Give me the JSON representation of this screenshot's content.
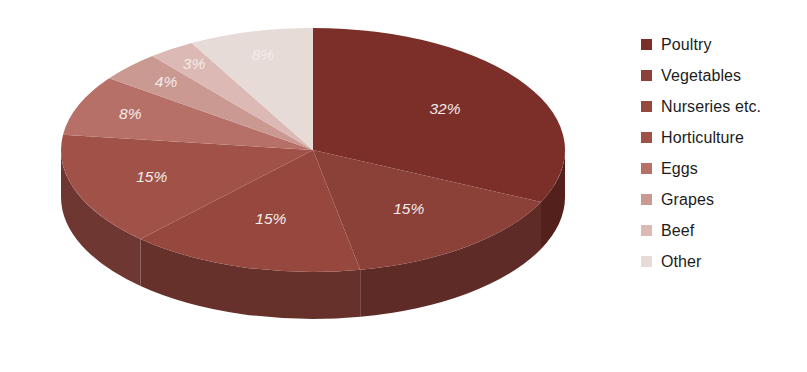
{
  "chart_data": {
    "type": "pie",
    "title": "",
    "subtitle": "",
    "xlabel": "",
    "ylabel": "",
    "legend_position": "right",
    "three_d": true,
    "start_angle_deg": 0,
    "direction": "clockwise",
    "categories": [
      "Poultry",
      "Vegetables",
      "Nurseries etc.",
      "Horticulture",
      "Eggs",
      "Grapes",
      "Beef",
      "Other"
    ],
    "values": [
      32,
      15,
      15,
      15,
      8,
      4,
      3,
      8
    ],
    "value_unit": "%",
    "data_labels": [
      "32%",
      "15%",
      "15%",
      "15%",
      "8%",
      "4%",
      "3%",
      "8%"
    ],
    "colors": [
      "#7b2f28",
      "#8b4038",
      "#96483f",
      "#a05249",
      "#b77068",
      "#c99992",
      "#dcb9b4",
      "#e6dbd6"
    ],
    "side_colors": [
      "#53201c",
      "#5e2b26",
      "#67312b",
      "#6e3731",
      "#7f4b45",
      "#8d6762",
      "#9c7e79",
      "#a89a95"
    ]
  },
  "legend": {
    "items": [
      {
        "label": "Poultry",
        "color": "#7b2f28"
      },
      {
        "label": "Vegetables",
        "color": "#8b4038"
      },
      {
        "label": "Nurseries etc.",
        "color": "#96483f"
      },
      {
        "label": "Horticulture",
        "color": "#a05249"
      },
      {
        "label": "Eggs",
        "color": "#b77068"
      },
      {
        "label": "Grapes",
        "color": "#c99992"
      },
      {
        "label": "Beef",
        "color": "#dcb9b4"
      },
      {
        "label": "Other",
        "color": "#e6dbd6"
      }
    ]
  }
}
